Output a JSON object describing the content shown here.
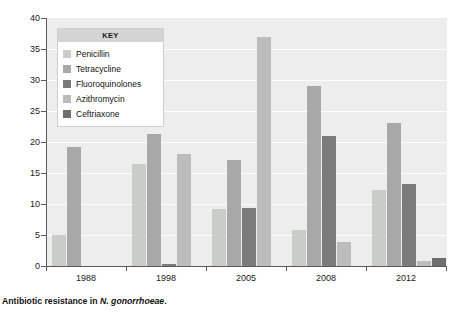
{
  "caption": {
    "prefix": "Antibiotic resistance in ",
    "species": "N. gonorrhoeae",
    "suffix": "."
  },
  "legend": {
    "title": "KEY",
    "items": [
      {
        "label": "Penicillin",
        "color": "#c8cdc8"
      },
      {
        "label": "Tetracycline",
        "color": "#a8a8a8"
      },
      {
        "label": "Fluoroquinolones",
        "color": "#7b7b7b"
      },
      {
        "label": "Azithromycin",
        "color": "#bcbcbc"
      },
      {
        "label": "Ceftriaxone",
        "color": "#6e6e6e"
      }
    ]
  },
  "axes": {
    "y_title": "Percentage of resistant isolates",
    "y_ticks": [
      "40",
      "35",
      "30",
      "25",
      "20",
      "15",
      "10",
      "5",
      "0"
    ],
    "y_min": 0,
    "y_max": 40,
    "y_step": 5,
    "x_labels": [
      "1988",
      "1998",
      "2005",
      "2008",
      "2012"
    ]
  },
  "chart_data": {
    "type": "bar",
    "title": "Antibiotic resistance in N. gonorrhoeae.",
    "xlabel": "",
    "ylabel": "Percentage of resistant isolates",
    "ylim": [
      0,
      40
    ],
    "ytick_step": 5,
    "grid": true,
    "legend_position": "inside-top-left",
    "categories": [
      "1988",
      "1998",
      "2005",
      "2008",
      "2012"
    ],
    "series": [
      {
        "name": "Penicillin",
        "color": "#c8cdc8",
        "values": [
          5.0,
          16.5,
          9.2,
          5.8,
          12.3
        ]
      },
      {
        "name": "Tetracycline",
        "color": "#a8a8a8",
        "values": [
          19.2,
          21.3,
          17.1,
          29.0,
          23.0
        ]
      },
      {
        "name": "Fluoroquinolones",
        "color": "#7b7b7b",
        "values": [
          0,
          0.4,
          9.4,
          21.0,
          13.3
        ]
      },
      {
        "name": "Azithromycin",
        "color": "#bcbcbc",
        "values": [
          0,
          18.0,
          37.0,
          3.8,
          0.8
        ]
      },
      {
        "name": "Ceftriaxone",
        "color": "#6e6e6e",
        "values": [
          0,
          0,
          0,
          0,
          1.3
        ]
      }
    ]
  }
}
